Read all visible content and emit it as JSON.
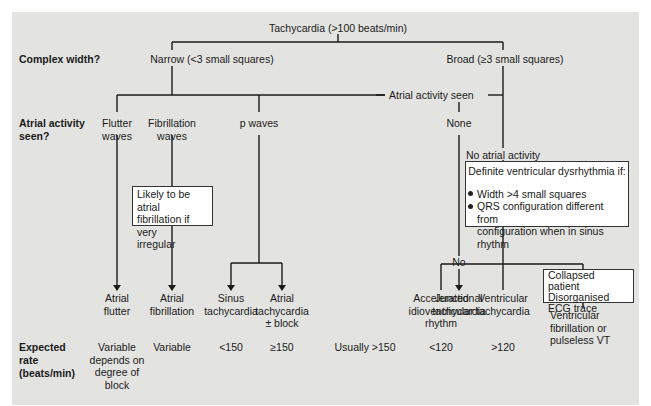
{
  "root": {
    "label": "Tachycardia (>100 beats/min)"
  },
  "row_labels": {
    "complex_width": "Complex width?",
    "atrial_activity_line1": "Atrial activity",
    "atrial_activity_line2": "seen?",
    "expected_rate_line1": "Expected",
    "expected_rate_line2": "rate",
    "expected_rate_line3": "(beats/min)"
  },
  "complex_width": {
    "narrow": "Narrow (<3 small squares)",
    "broad": "Broad (≥3 small squares)"
  },
  "connectors": {
    "atrial_activity_seen": "Atrial activity seen",
    "no_atrial_activity": "No atrial activity",
    "no": "No"
  },
  "atrial_findings": {
    "flutter_line1": "Flutter",
    "flutter_line2": "waves",
    "fibrillation_line1": "Fibrillation",
    "fibrillation_line2": "waves",
    "p_waves": "p waves",
    "none": "None"
  },
  "notes": {
    "af_note_line1": "Likely to be atrial",
    "af_note_line2": "fibrillation if very",
    "af_note_line3": "irregular",
    "dvd_title": "Definite ventricular dysrhythmia if:",
    "dvd_bullet1": "Width >4 small squares",
    "dvd_bullet2_line1": "QRS configuration different from",
    "dvd_bullet2_line2": "configuration when in sinus rhythm",
    "collapsed_line1": "Collapsed patient",
    "collapsed_line2": "Disorganised",
    "collapsed_line3": "ECG trace"
  },
  "diagnoses": [
    {
      "line1": "Atrial",
      "line2": "flutter",
      "line3": "",
      "rate": [
        "Variable",
        "depends on",
        "degree of",
        "block"
      ]
    },
    {
      "line1": "Atrial",
      "line2": "fibrillation",
      "line3": "",
      "rate": [
        "Variable"
      ]
    },
    {
      "line1": "Sinus",
      "line2": "tachycardia",
      "line3": "",
      "rate": [
        "<150"
      ]
    },
    {
      "line1": "Atrial",
      "line2": "tachycardia",
      "line3": "± block",
      "rate": [
        "≥150"
      ]
    },
    {
      "line1": "Junctional",
      "line2": "tachycardia",
      "line3": "",
      "rate": [
        "Usually >150"
      ]
    },
    {
      "line1": "Accelerated",
      "line2": "idioventricular",
      "line3": "rhythm",
      "rate": [
        "<120"
      ]
    },
    {
      "line1": "Ventricular",
      "line2": "tachycardia",
      "line3": "",
      "rate": [
        ">120"
      ]
    },
    {
      "line1": "Ventricular",
      "line2": "fibrillation or",
      "line3": "pulseless VT",
      "rate": []
    }
  ],
  "colors": {
    "panel_bg": "#e3e3e1",
    "line": "#1a1a1a",
    "box_bg": "#ffffff"
  }
}
